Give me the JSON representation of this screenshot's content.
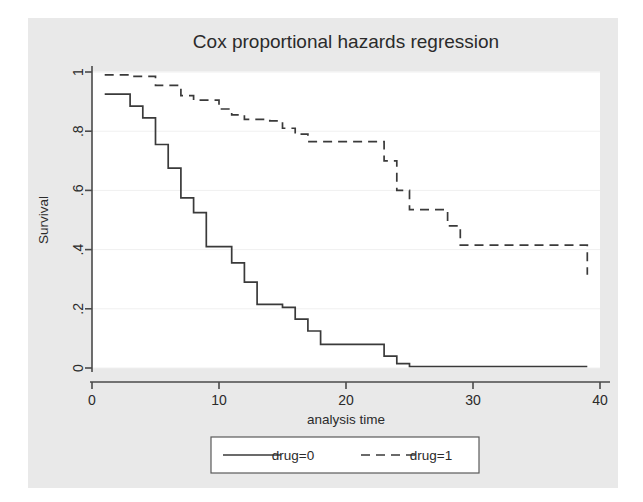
{
  "figure": {
    "background_color": "#ffffff",
    "plot_region_color": "#e9e9e9",
    "plot_area_color": "#ffffff",
    "axis_color": "#4a4a4a",
    "grid_color": "#f0f0f0",
    "curve_color": "#3a3a3a"
  },
  "chart_data": {
    "type": "line",
    "title": "Cox proportional hazards regression",
    "xlabel": "analysis time",
    "ylabel": "Survival",
    "xlim": [
      0,
      40
    ],
    "ylim": [
      0,
      1
    ],
    "xticks": [
      0,
      10,
      20,
      30,
      40
    ],
    "xticklabels": [
      "0",
      "10",
      "20",
      "30",
      "40"
    ],
    "yticks": [
      0,
      0.2,
      0.4,
      0.6,
      0.8,
      1
    ],
    "yticklabels": [
      "0",
      ".2",
      ".4",
      ".6",
      ".8",
      "1"
    ],
    "grid": "horizontal",
    "legend_position": "below",
    "step_style": "post",
    "series": [
      {
        "name": "drug=0",
        "label": "drug=0",
        "linestyle": "solid",
        "x": [
          1,
          2,
          3,
          4,
          5,
          6,
          7,
          8,
          9,
          10,
          11,
          12,
          13,
          15,
          16,
          17,
          18,
          22,
          23,
          24,
          25,
          39
        ],
        "y": [
          0.925,
          0.925,
          0.885,
          0.845,
          0.755,
          0.675,
          0.575,
          0.525,
          0.41,
          0.41,
          0.355,
          0.29,
          0.215,
          0.205,
          0.165,
          0.125,
          0.08,
          0.08,
          0.04,
          0.015,
          0.005,
          0.005
        ]
      },
      {
        "name": "drug=1",
        "label": "drug=1",
        "linestyle": "dashed",
        "x": [
          1,
          3,
          5,
          7,
          8,
          10,
          11,
          12,
          14,
          15,
          16,
          17,
          22,
          23,
          24,
          25,
          28,
          29,
          33,
          39
        ],
        "y": [
          0.99,
          0.985,
          0.955,
          0.92,
          0.905,
          0.875,
          0.855,
          0.84,
          0.835,
          0.81,
          0.79,
          0.765,
          0.765,
          0.7,
          0.6,
          0.535,
          0.48,
          0.415,
          0.415,
          0.315
        ]
      }
    ]
  },
  "legend": {
    "entries": [
      {
        "label": "drug=0",
        "style": "solid"
      },
      {
        "label": "drug=1",
        "style": "dashed"
      }
    ]
  }
}
